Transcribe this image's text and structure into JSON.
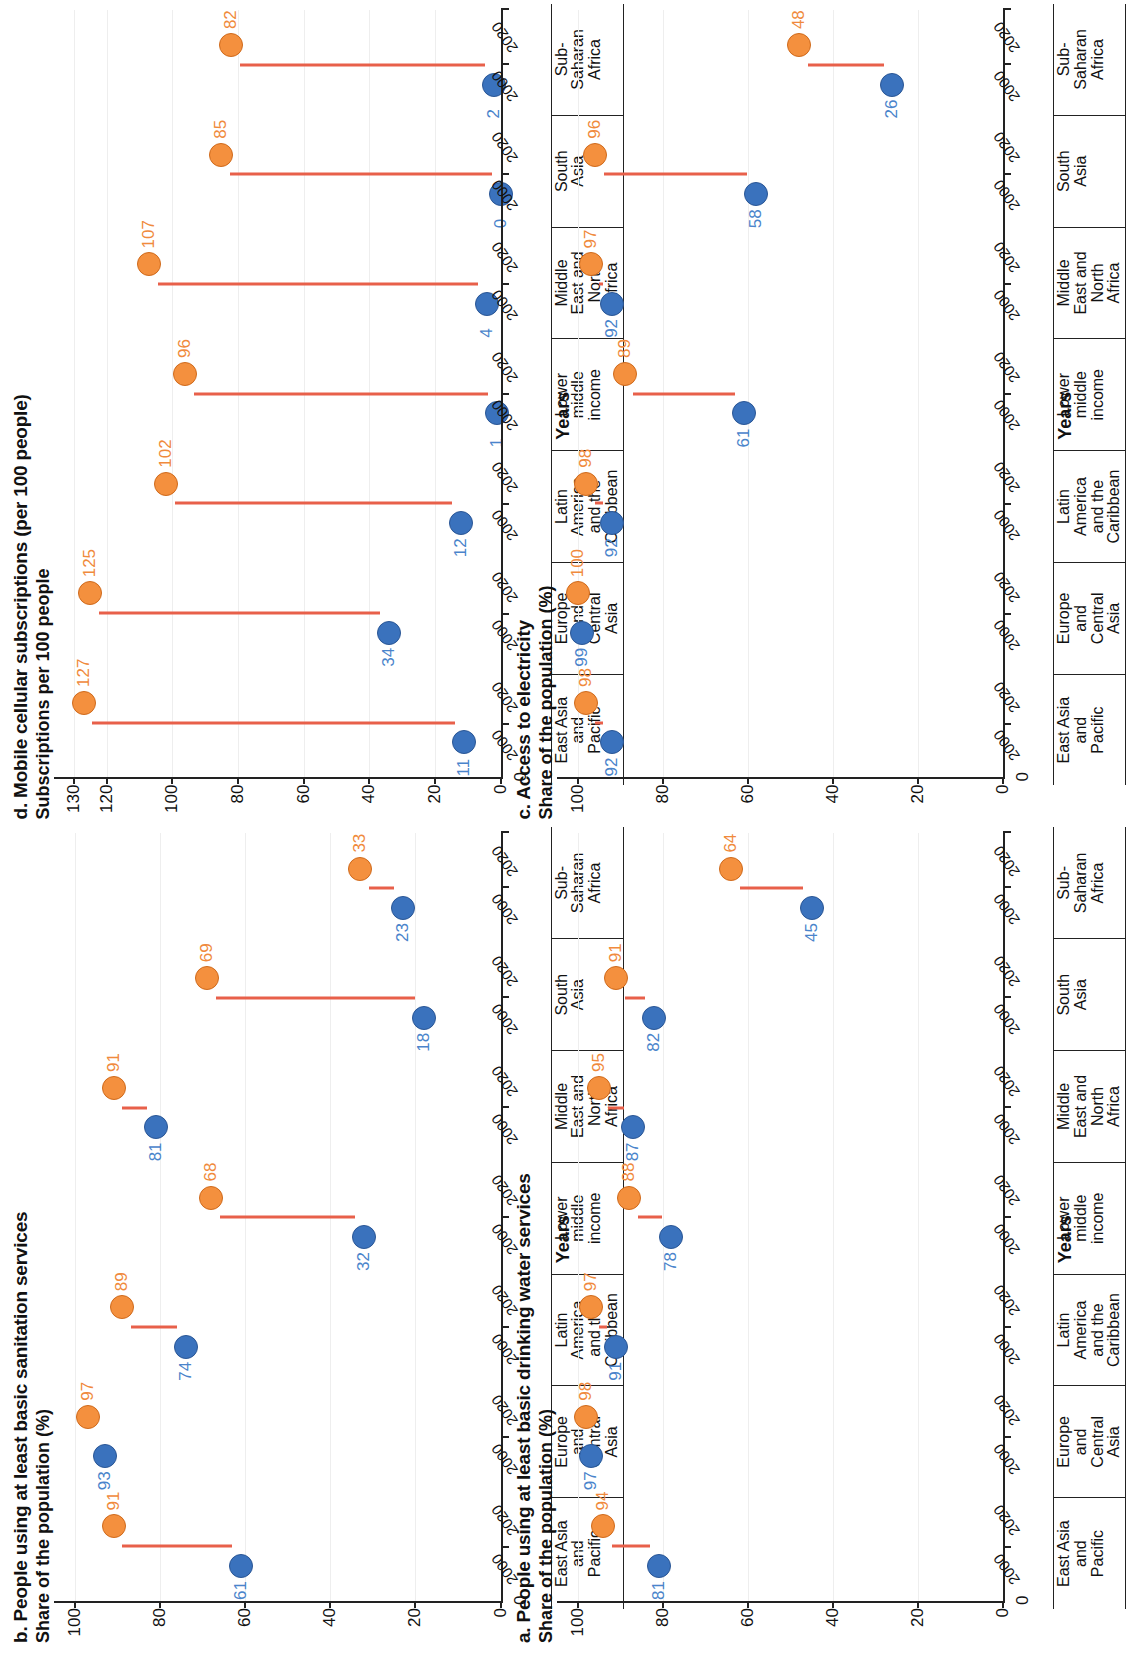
{
  "figure": {
    "x_axis_title": "Years",
    "year_labels": [
      "2000",
      "2020"
    ],
    "categories": [
      "East Asia and Pacific",
      "Europe and Central Asia",
      "Latin America and the Caribbean",
      "Lower middle income",
      "Middle East and North Africa",
      "South Asia",
      "Sub-Saharan Africa"
    ],
    "category_lines": [
      [
        "East Asia",
        "and",
        "Pacific"
      ],
      [
        "Europe",
        "and",
        "Central",
        "Asia"
      ],
      [
        "Latin",
        "America",
        "and the",
        "Caribbean"
      ],
      [
        "Lower",
        "middle",
        "income"
      ],
      [
        "Middle",
        "East and",
        "North",
        "Africa"
      ],
      [
        "South",
        "Asia"
      ],
      [
        "Sub-",
        "Saharan",
        "Africa"
      ]
    ],
    "colors": {
      "series_2000": "#3a72bd",
      "series_2020": "#f4903e",
      "connector": "#e8604a",
      "axis": "#222222",
      "grid": "#eeeeee"
    }
  },
  "panels": [
    {
      "key": "a",
      "title": "a. People using at least basic drinking water services",
      "y_axis_title": "Share of the population (%)",
      "chart_data": {
        "type": "scatter",
        "title": "a. People using at least basic drinking water services",
        "xlabel": "Years",
        "ylabel": "Share of the population (%)",
        "ylim": [
          0,
          105
        ],
        "yticks": [
          0,
          20,
          40,
          60,
          80,
          100
        ],
        "grid": true,
        "legend": "none",
        "categories": [
          "East Asia and Pacific",
          "Europe and Central Asia",
          "Latin America and the Caribbean",
          "Lower middle income",
          "Middle East and North Africa",
          "South Asia",
          "Sub-Saharan Africa"
        ],
        "series": [
          {
            "name": "2000",
            "values": [
              81,
              97,
              91,
              78,
              87,
              82,
              45
            ]
          },
          {
            "name": "2020",
            "values": [
              94,
              98,
              97,
              88,
              95,
              91,
              64
            ]
          }
        ]
      }
    },
    {
      "key": "b",
      "title": "b. People using at least basic sanitation services",
      "y_axis_title": "Share of the population (%)",
      "chart_data": {
        "type": "scatter",
        "title": "b. People using at least basic sanitation services",
        "xlabel": "Years",
        "ylabel": "Share of the population (%)",
        "ylim": [
          0,
          105
        ],
        "yticks": [
          0,
          20,
          40,
          60,
          80,
          100
        ],
        "grid": true,
        "legend": "none",
        "categories": [
          "East Asia and Pacific",
          "Europe and Central Asia",
          "Latin America and the Caribbean",
          "Lower middle income",
          "Middle East and North Africa",
          "South Asia",
          "Sub-Saharan Africa"
        ],
        "series": [
          {
            "name": "2000",
            "values": [
              61,
              93,
              74,
              32,
              81,
              18,
              23
            ]
          },
          {
            "name": "2020",
            "values": [
              91,
              97,
              89,
              68,
              91,
              69,
              33
            ]
          }
        ]
      }
    },
    {
      "key": "c",
      "title": "c. Access to electricity",
      "y_axis_title": "Share of the population (%)",
      "chart_data": {
        "type": "scatter",
        "title": "c. Access to electricity",
        "xlabel": "Years",
        "ylabel": "Share of the population (%)",
        "ylim": [
          0,
          105
        ],
        "yticks": [
          0,
          20,
          40,
          60,
          80,
          100
        ],
        "grid": true,
        "legend": "none",
        "categories": [
          "East Asia and Pacific",
          "Europe and Central Asia",
          "Latin America and the Caribbean",
          "Lower middle income",
          "Middle East and North Africa",
          "South Asia",
          "Sub-Saharan Africa"
        ],
        "series": [
          {
            "name": "2000",
            "values": [
              92,
              99,
              92,
              61,
              92,
              58,
              26
            ]
          },
          {
            "name": "2020",
            "values": [
              98,
              100,
              98,
              89,
              97,
              96,
              48
            ]
          }
        ]
      }
    },
    {
      "key": "d",
      "title": "d. Mobile cellular subscriptions (per 100 people)",
      "y_axis_title": "Subscriptions per 100 people",
      "chart_data": {
        "type": "scatter",
        "title": "d. Mobile cellular subscriptions (per 100 people)",
        "xlabel": "Years",
        "ylabel": "Subscriptions per 100 people",
        "ylim": [
          0,
          136
        ],
        "yticks": [
          0,
          20,
          40,
          60,
          80,
          100,
          120,
          130
        ],
        "grid": true,
        "legend": "none",
        "categories": [
          "East Asia and Pacific",
          "Europe and Central Asia",
          "Latin America and the Caribbean",
          "Lower middle income",
          "Middle East and North Africa",
          "South Asia",
          "Sub-Saharan Africa"
        ],
        "series": [
          {
            "name": "2000",
            "values": [
              11,
              34,
              12,
              1,
              4,
              0,
              2
            ]
          },
          {
            "name": "2020",
            "values": [
              127,
              125,
              102,
              96,
              107,
              85,
              82
            ]
          }
        ]
      }
    }
  ]
}
